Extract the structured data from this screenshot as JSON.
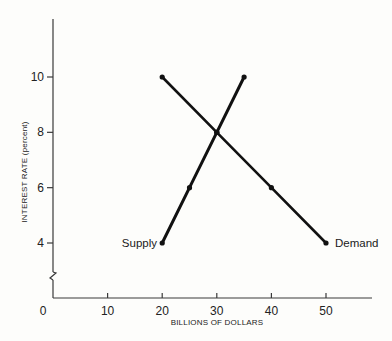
{
  "chart_data": {
    "type": "line",
    "title": "",
    "xlabel": "BILLIONS OF DOLLARS",
    "ylabel": "INTEREST RATE (percent)",
    "xlim": [
      0,
      55
    ],
    "ylim": [
      2,
      12
    ],
    "x_ticks": [
      0,
      10,
      20,
      30,
      40,
      50
    ],
    "y_ticks": [
      4,
      6,
      8,
      10
    ],
    "x_tick_labels": [
      "0",
      "10",
      "20",
      "30",
      "40",
      "50"
    ],
    "y_tick_labels": [
      "4",
      "6",
      "8",
      "10"
    ],
    "y_axis_break": true,
    "grid": false,
    "legend": "inline labels at line ends",
    "series": [
      {
        "name": "Supply",
        "label_position": "left of lower endpoint",
        "points": [
          {
            "x": 20,
            "y": 4
          },
          {
            "x": 25,
            "y": 6
          },
          {
            "x": 30,
            "y": 8
          },
          {
            "x": 35,
            "y": 10
          }
        ]
      },
      {
        "name": "Demand",
        "label_position": "right of lower endpoint",
        "points": [
          {
            "x": 20,
            "y": 10
          },
          {
            "x": 30,
            "y": 8
          },
          {
            "x": 40,
            "y": 6
          },
          {
            "x": 50,
            "y": 4
          }
        ]
      }
    ],
    "annotations": [
      {
        "text": "equilibrium intersection",
        "x": 30,
        "y": 8
      }
    ]
  },
  "labels": {
    "supply": "Supply",
    "demand": "Demand",
    "xlabel": "BILLIONS OF DOLLARS",
    "ylabel": "INTEREST RATE (percent)"
  }
}
